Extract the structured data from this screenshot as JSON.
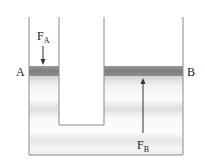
{
  "diagram": {
    "type": "hydraulic-press",
    "labels": {
      "piston_a": "A",
      "piston_b": "B",
      "force_a": "F",
      "force_a_sub": "A",
      "force_b": "F",
      "force_b_sub": "B"
    },
    "colors": {
      "wall": "#8a8a8a",
      "piston": "#8c8c8c",
      "fluid_light": "#f4f4f4",
      "fluid_band": "#dcdcdc",
      "arrow": "#333333"
    }
  }
}
